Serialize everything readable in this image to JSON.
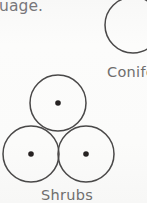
{
  "page": {
    "width": 147,
    "height": 203,
    "background_color": "#fbfbfa",
    "kind": "scanned-figure-fragment"
  },
  "colors": {
    "paper": "#fbfbfa",
    "ink_text": "#6f6e6d",
    "ink_text_light": "#77767a",
    "stroke": "#4a4848",
    "dot_fill": "#262424"
  },
  "text": {
    "body_fragment": "uage.",
    "label_conifers": "Conife",
    "label_shrubs": "Shrubs"
  },
  "figure": {
    "title_symbols": "tree canopy plan symbols",
    "conifer_symbol": {
      "label": "Conife",
      "shape": "circle",
      "clipped": "right-edge",
      "center_x": 133,
      "center_y": 25,
      "radius": 28,
      "stroke_width": 1.5,
      "has_center_dot": false
    },
    "shrub_symbol": {
      "label": "Shrubs",
      "shape": "three-tangent-circles",
      "arrangement": "triangular",
      "stroke_width": 1.5,
      "dot_radius": 2.8,
      "circles": [
        {
          "name": "top",
          "center_x": 58,
          "center_y": 103,
          "radius": 28,
          "has_center_dot": true
        },
        {
          "name": "bottom-left",
          "center_x": 31,
          "center_y": 154,
          "radius": 28,
          "has_center_dot": true
        },
        {
          "name": "bottom-right",
          "center_x": 86,
          "center_y": 154,
          "radius": 28,
          "has_center_dot": true
        }
      ]
    }
  }
}
